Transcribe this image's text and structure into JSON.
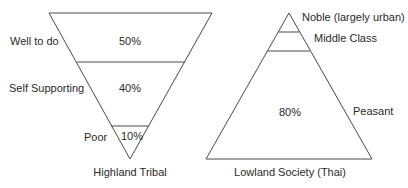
{
  "diagram": {
    "type": "social-structure-comparison",
    "line_color": "#4a4a4a",
    "left": {
      "caption": "Highland Tribal",
      "shape": "inverted-triangle",
      "tiers": [
        {
          "label": "Well to do",
          "percent": "50%"
        },
        {
          "label": "Self Supporting",
          "percent": "40%"
        },
        {
          "label": "Poor",
          "percent": "10%"
        }
      ]
    },
    "right": {
      "caption": "Lowland Society (Thai)",
      "shape": "triangle",
      "tiers": [
        {
          "label": "Noble (largely urban)",
          "percent": ""
        },
        {
          "label": "Middle Class",
          "percent": ""
        },
        {
          "label": "Peasant",
          "percent": "80%"
        }
      ]
    }
  }
}
